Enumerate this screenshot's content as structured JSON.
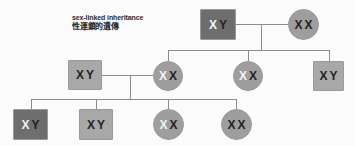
{
  "diagram": {
    "title_en": "sex-linked inheritance",
    "title_zh": "性連鎖的遺傳",
    "type": "pedigree-chart",
    "background_color": "#fbfbfb",
    "line_color": "#8c8c8c",
    "palette": {
      "affected_fill": "#6e6e6e",
      "normal_fill": "#a8a8a8",
      "carrier_fill": "#9e9e9e",
      "allele_recessive_color": "#f2f2f2",
      "allele_normal_color": "#232323"
    },
    "generations": [
      {
        "label": "generation-1",
        "members": [
          {
            "id": "g1-father",
            "shape": "square",
            "sex": "male",
            "fill": "dark",
            "alleles": [
              {
                "text": "X",
                "style": "white"
              },
              {
                "text": "Y",
                "style": "dark"
              }
            ],
            "genotype": "XY"
          },
          {
            "id": "g1-mother",
            "shape": "circle",
            "sex": "female",
            "fill": "carrier",
            "alleles": [
              {
                "text": "X",
                "style": "dark"
              },
              {
                "text": "X",
                "style": "dark"
              }
            ],
            "genotype": "XX"
          }
        ]
      },
      {
        "label": "generation-2",
        "members": [
          {
            "id": "g2-father",
            "shape": "square",
            "sex": "male",
            "fill": "light",
            "alleles": [
              {
                "text": "X",
                "style": "dark"
              },
              {
                "text": "Y",
                "style": "dark"
              }
            ],
            "genotype": "XY"
          },
          {
            "id": "g2-daughter-1",
            "shape": "circle",
            "sex": "female",
            "fill": "carrier",
            "alleles": [
              {
                "text": "X",
                "style": "white"
              },
              {
                "text": "X",
                "style": "dark"
              }
            ],
            "genotype": "XX"
          },
          {
            "id": "g2-daughter-2",
            "shape": "circle",
            "sex": "female",
            "fill": "carrier",
            "alleles": [
              {
                "text": "X",
                "style": "white"
              },
              {
                "text": "X",
                "style": "dark"
              }
            ],
            "genotype": "XX"
          },
          {
            "id": "g2-son",
            "shape": "square",
            "sex": "male",
            "fill": "light",
            "alleles": [
              {
                "text": "X",
                "style": "dark"
              },
              {
                "text": "Y",
                "style": "dark"
              }
            ],
            "genotype": "XY"
          }
        ]
      },
      {
        "label": "generation-3",
        "members": [
          {
            "id": "g3-son-1",
            "shape": "square",
            "sex": "male",
            "fill": "dark",
            "alleles": [
              {
                "text": "X",
                "style": "white"
              },
              {
                "text": "Y",
                "style": "dark"
              }
            ],
            "genotype": "XY"
          },
          {
            "id": "g3-son-2",
            "shape": "square",
            "sex": "male",
            "fill": "light",
            "alleles": [
              {
                "text": "X",
                "style": "dark"
              },
              {
                "text": "Y",
                "style": "dark"
              }
            ],
            "genotype": "XY"
          },
          {
            "id": "g3-daughter-1",
            "shape": "circle",
            "sex": "female",
            "fill": "carrier",
            "alleles": [
              {
                "text": "X",
                "style": "white"
              },
              {
                "text": "X",
                "style": "dark"
              }
            ],
            "genotype": "XX"
          },
          {
            "id": "g3-daughter-2",
            "shape": "circle",
            "sex": "female",
            "fill": "carrier",
            "alleles": [
              {
                "text": "X",
                "style": "dark"
              },
              {
                "text": "X",
                "style": "dark"
              }
            ],
            "genotype": "XX"
          }
        ]
      }
    ]
  }
}
